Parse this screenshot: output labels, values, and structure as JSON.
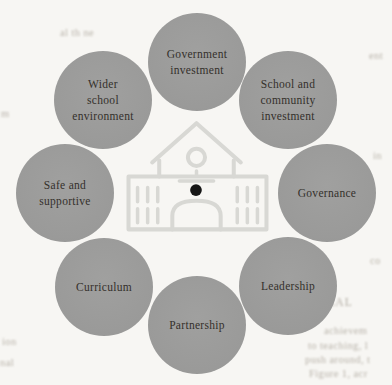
{
  "page": {
    "background_color": "#f7f6f3",
    "kind": "book-figure-scan"
  },
  "diagram": {
    "type": "cycle",
    "center_icon": "school-building",
    "circle_color": "#9c9c9c",
    "label_color": "#34302b",
    "icon_stroke_color": "#d8d8d4",
    "icon_dot_color": "#161616",
    "nodes": [
      {
        "id": "government-investment",
        "position": "top",
        "label": "Government investment",
        "lines": [
          "Government",
          "investment"
        ]
      },
      {
        "id": "school-and-community-investment",
        "position": "top-right",
        "label": "School and community investment",
        "lines": [
          "School and",
          "community",
          "investment"
        ]
      },
      {
        "id": "governance",
        "position": "right",
        "label": "Governance",
        "lines": [
          "Governance"
        ]
      },
      {
        "id": "leadership",
        "position": "bottom-right",
        "label": "Leadership",
        "lines": [
          "Leadership"
        ]
      },
      {
        "id": "partnership",
        "position": "bottom",
        "label": "Partnership",
        "lines": [
          "Partnership"
        ]
      },
      {
        "id": "curriculum",
        "position": "bottom-left",
        "label": "Curriculum",
        "lines": [
          "Curriculum"
        ]
      },
      {
        "id": "safe-and-supportive",
        "position": "left",
        "label": "Safe and supportive",
        "lines": [
          "Safe and",
          "supportive"
        ]
      },
      {
        "id": "wider-school-environment",
        "position": "top-left",
        "label": "Wider school environment",
        "lines": [
          "Wider",
          "school",
          "environment"
        ]
      }
    ]
  },
  "scan_bleed": {
    "note": "illegible print bleed-through around figure edges",
    "fragments": [
      {
        "text": "al th ne"
      },
      {
        "text": "ent"
      },
      {
        "text": "m"
      },
      {
        "text": "in"
      },
      {
        "text": "co"
      },
      {
        "text": "HEAL"
      },
      {
        "text": "achievem"
      },
      {
        "text": "to teaching, l"
      },
      {
        "text": "push around, t"
      },
      {
        "text": "Figure 1, acr"
      },
      {
        "text": "ion"
      },
      {
        "text": "nal"
      }
    ]
  }
}
